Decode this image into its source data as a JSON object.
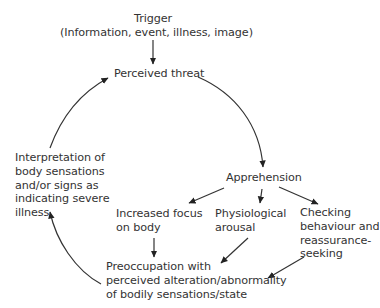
{
  "diagram": {
    "type": "cycle-flow",
    "nodes": {
      "trigger": {
        "lines": [
          "Trigger",
          "(Information, event, illness, image)"
        ]
      },
      "perceived_threat": {
        "lines": [
          "Perceived threat"
        ]
      },
      "apprehension": {
        "lines": [
          "Apprehension"
        ]
      },
      "increased_focus": {
        "lines": [
          "Increased focus",
          "on body"
        ]
      },
      "physiological_arousal": {
        "lines": [
          "Physiological",
          "arousal"
        ]
      },
      "checking_behaviour": {
        "lines": [
          "Checking",
          "behaviour and",
          "reassurance-",
          "seeking"
        ]
      },
      "preoccupation": {
        "lines": [
          "Preoccupation with",
          "perceived alteration/abnormality",
          "of bodily sensations/state"
        ]
      },
      "interpretation": {
        "lines": [
          "Interpretation of",
          "body sensations",
          "and/or signs as",
          "indicating severe",
          "illness"
        ]
      }
    },
    "edges": [
      {
        "from": "trigger",
        "to": "perceived_threat",
        "style": "straight"
      },
      {
        "from": "perceived_threat",
        "to": "apprehension",
        "style": "curved"
      },
      {
        "from": "apprehension",
        "to": "increased_focus",
        "style": "straight"
      },
      {
        "from": "apprehension",
        "to": "physiological_arousal",
        "style": "straight"
      },
      {
        "from": "apprehension",
        "to": "checking_behaviour",
        "style": "straight"
      },
      {
        "from": "increased_focus",
        "to": "preoccupation",
        "style": "straight"
      },
      {
        "from": "physiological_arousal",
        "to": "preoccupation",
        "style": "straight"
      },
      {
        "from": "checking_behaviour",
        "to": "preoccupation",
        "style": "straight"
      },
      {
        "from": "preoccupation",
        "to": "interpretation",
        "style": "curved"
      },
      {
        "from": "interpretation",
        "to": "perceived_threat",
        "style": "curved"
      }
    ],
    "colors": {
      "text": "#333333",
      "arrow": "#222222",
      "background": "#ffffff"
    }
  }
}
